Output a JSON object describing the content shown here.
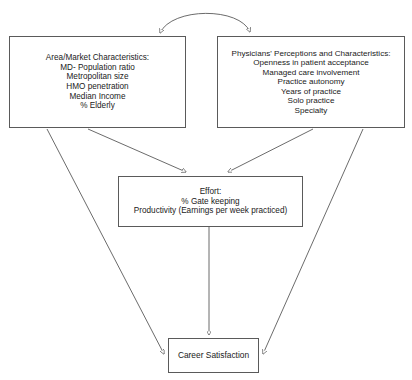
{
  "diagram": {
    "stroke_color": "#5a5a5a",
    "text_color": "#1a1a1a",
    "background_color": "#ffffff",
    "nodes": {
      "area_market": {
        "name": "Area/Market Characteristics",
        "lines": [
          "Area/Market Characteristics:",
          "MD- Population ratio",
          "Metropolitan size",
          "HMO penetration",
          "Median Income",
          "% Elderly"
        ]
      },
      "physicians": {
        "name": "Physicians' Perceptions and Characteristics",
        "lines": [
          "Physicians' Perceptions and Characteristics:",
          "Openness in patient acceptance",
          "Managed care involvement",
          "Practice autonomy",
          "Years of practice",
          "Solo practice",
          "Specialty"
        ]
      },
      "effort": {
        "name": "Effort",
        "lines": [
          "Effort:",
          "% Gate keeping",
          "Productivity (Earnings per week practiced)"
        ]
      },
      "career_satisfaction": {
        "name": "Career Satisfaction",
        "lines": [
          "Career Satisfaction"
        ]
      }
    },
    "edges": [
      {
        "id": "area-to-physicians",
        "from": "area_market",
        "to": "physicians",
        "style": "curved",
        "arrowheads": "both"
      },
      {
        "id": "area-to-effort",
        "from": "area_market",
        "to": "effort",
        "style": "straight",
        "arrowheads": "end"
      },
      {
        "id": "physicians-to-effort",
        "from": "physicians",
        "to": "effort",
        "style": "straight",
        "arrowheads": "end"
      },
      {
        "id": "area-to-career",
        "from": "area_market",
        "to": "career_satisfaction",
        "style": "straight",
        "arrowheads": "end"
      },
      {
        "id": "physicians-to-career",
        "from": "physicians",
        "to": "career_satisfaction",
        "style": "straight",
        "arrowheads": "end"
      },
      {
        "id": "effort-to-career",
        "from": "effort",
        "to": "career_satisfaction",
        "style": "straight",
        "arrowheads": "end"
      }
    ]
  }
}
